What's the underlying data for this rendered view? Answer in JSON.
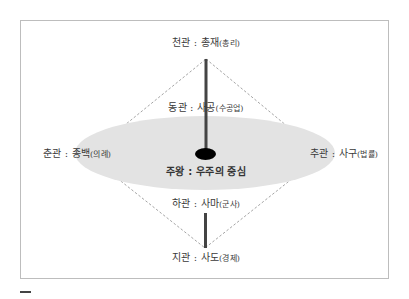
{
  "diagram": {
    "title": "",
    "colors": {
      "ellipse_fill": "#e3e3e3",
      "axis_bar": "#444444",
      "center_dot": "#000000",
      "dashed_outline": "#9a9a9a",
      "frame_border": "#bdbdbd"
    },
    "nodes": {
      "top": {
        "label": "천관 : 총재",
        "sub": "(총리)"
      },
      "upper": {
        "label": "동관 : 사공",
        "sub": "(수공업)"
      },
      "left": {
        "label": "춘관 : 종백",
        "sub": "(의례)"
      },
      "right": {
        "label": "추관 : 사구",
        "sub": "(법률)"
      },
      "center": {
        "label": "주왕 : 우주의 중심"
      },
      "lower": {
        "label": "하관 : 사마",
        "sub": "(군사)"
      },
      "bottom": {
        "label": "지관 : 사도",
        "sub": "(경제)"
      }
    }
  }
}
